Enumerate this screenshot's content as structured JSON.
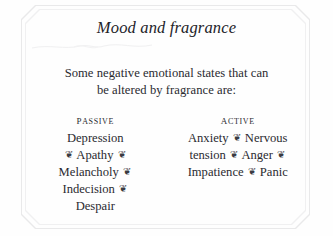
{
  "page": {
    "background_color": "#fefefe",
    "text_color": "#2a2a30",
    "border_color": "#e9e9ea"
  },
  "title": "Mood and fragrance",
  "subtitle": "Some negative emotional states that can be altered by fragrance are:",
  "subtitle_lines": [
    "Some negative emotional states that can",
    "be altered by fragrance are:"
  ],
  "separator_glyph": "❦",
  "columns": [
    {
      "heading": "Passive",
      "lines": [
        "Depression",
        "❦ Apathy ❦",
        "Melancholy ❦",
        "Indecision ❦",
        "Despair"
      ],
      "items": [
        "Depression",
        "Apathy",
        "Melancholy",
        "Indecision",
        "Despair"
      ]
    },
    {
      "heading": "Active",
      "lines": [
        "Anxiety ❦ Nervous",
        "tension ❦ Anger ❦",
        "Impatience ❦ Panic"
      ],
      "items": [
        "Anxiety",
        "Nervous tension",
        "Anger",
        "Impatience",
        "Panic"
      ]
    }
  ]
}
